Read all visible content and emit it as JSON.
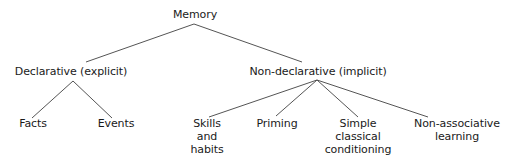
{
  "diagram": {
    "type": "tree",
    "root": {
      "label": "Memory",
      "children": [
        {
          "label": "Declarative (explicit)",
          "children": [
            {
              "label": "Facts"
            },
            {
              "label": "Events"
            }
          ]
        },
        {
          "label": "Non-declarative (implicit)",
          "children": [
            {
              "label": "Skills and habits"
            },
            {
              "label": "Priming"
            },
            {
              "label": "Simple classical conditioning"
            },
            {
              "label": "Non-associative learning"
            }
          ]
        }
      ]
    }
  },
  "nodes": {
    "memory": {
      "lines": [
        "Memory"
      ]
    },
    "declarative": {
      "lines": [
        "Declarative (explicit)"
      ]
    },
    "nondeclarative": {
      "lines": [
        "Non-declarative (implicit)"
      ]
    },
    "facts": {
      "lines": [
        "Facts"
      ]
    },
    "events": {
      "lines": [
        "Events"
      ]
    },
    "skills": {
      "lines": [
        "Skills",
        "and",
        "habits"
      ]
    },
    "priming": {
      "lines": [
        "Priming"
      ]
    },
    "conditioning": {
      "lines": [
        "Simple",
        "classical",
        "conditioning"
      ]
    },
    "nonassociative": {
      "lines": [
        "Non-associative",
        "learning"
      ]
    }
  },
  "colors": {
    "line": "#555555",
    "text": "#1a1a1a",
    "background": "#ffffff"
  }
}
